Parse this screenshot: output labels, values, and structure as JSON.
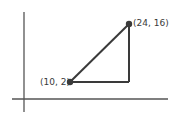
{
  "diagram": {
    "type": "coordinate-plane-right-triangle",
    "points": [
      {
        "label": "(10, 2)",
        "x": 10,
        "y": 2
      },
      {
        "label": "(24, 16)",
        "x": 24,
        "y": 16
      }
    ],
    "right_angle_vertex": {
      "x": 24,
      "y": 2
    },
    "colors": {
      "line": "#3a3a3a",
      "point": "#3a3a3a",
      "axis": "#555555"
    }
  }
}
